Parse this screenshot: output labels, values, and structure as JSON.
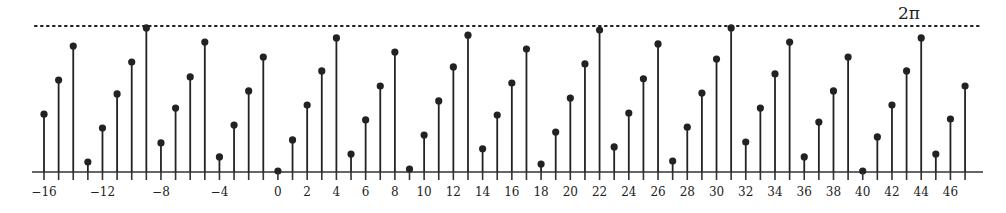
{
  "chart_data": {
    "type": "stem",
    "title": "",
    "xlabel": "",
    "ylabel": "",
    "x_start": -16,
    "x_end": 47,
    "x": [
      -16,
      -15,
      -14,
      -13,
      -12,
      -11,
      -10,
      -9,
      -8,
      -7,
      -6,
      -5,
      -4,
      -3,
      -2,
      -1,
      0,
      1,
      2,
      3,
      4,
      5,
      6,
      7,
      8,
      9,
      10,
      11,
      12,
      13,
      14,
      15,
      16,
      17,
      18,
      19,
      20,
      21,
      22,
      23,
      24,
      25,
      26,
      27,
      28,
      29,
      30,
      31,
      32,
      33,
      34,
      35,
      36,
      37,
      38,
      39,
      40,
      41,
      42,
      43,
      44,
      45,
      46,
      47
    ],
    "values": [
      2.49,
      3.96,
      5.42,
      0.43,
      1.89,
      3.36,
      4.73,
      6.2,
      1.25,
      2.75,
      4.09,
      5.59,
      0.65,
      2.02,
      3.49,
      4.95,
      0.04,
      1.38,
      2.88,
      4.35,
      5.77,
      0.77,
      2.24,
      3.7,
      5.16,
      0.13,
      1.59,
      3.06,
      4.52,
      5.89,
      1.0,
      2.45,
      3.83,
      5.29,
      0.34,
      1.72,
      3.18,
      4.65,
      6.11,
      1.08,
      2.54,
      4.01,
      5.51,
      0.47,
      1.93,
      3.4,
      4.86,
      6.2,
      1.29,
      2.75,
      4.22,
      5.59,
      0.65,
      2.15,
      3.49,
      4.95,
      0.04,
      1.51,
      2.88,
      4.35,
      5.77,
      0.77,
      2.28,
      3.7
    ],
    "ylim": [
      0,
      6.2832
    ],
    "reference_line": {
      "value": 6.2832,
      "label": "2π",
      "style": "dotted"
    },
    "tick_labels": [
      "−16",
      "−12",
      "−8",
      "−4",
      "0",
      "2",
      "4",
      "6",
      "8",
      "10",
      "12",
      "14",
      "16",
      "18",
      "20",
      "22",
      "24",
      "26",
      "28",
      "30",
      "32",
      "34",
      "36",
      "38",
      "40",
      "42",
      "44",
      "46"
    ],
    "tick_positions": [
      -16,
      -12,
      -8,
      -4,
      0,
      2,
      4,
      6,
      8,
      10,
      12,
      14,
      16,
      18,
      20,
      22,
      24,
      26,
      28,
      30,
      32,
      34,
      36,
      38,
      40,
      42,
      44,
      46
    ],
    "grid": false,
    "legend": null,
    "colors": {
      "stem": "#222222",
      "axis": "#333333",
      "dots": "#222222"
    }
  }
}
